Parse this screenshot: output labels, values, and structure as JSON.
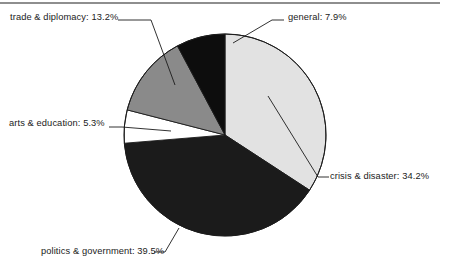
{
  "page": {
    "background_color": "#ffffff",
    "width": 449,
    "height": 271,
    "top_rule_color": "#8e8e8e"
  },
  "chart_data": {
    "type": "pie",
    "title": "",
    "subtitle": "",
    "xlabel": "",
    "ylabel": "",
    "grid": false,
    "legend_position": "none",
    "label_format": "{name}: {value}%",
    "start_angle_deg": 0,
    "direction": "clockwise",
    "center": {
      "x": 225,
      "y": 135
    },
    "radius": 101,
    "outline_color": "#1b1b1b",
    "categories": [
      "crisis & disaster",
      "politics & government",
      "arts & education",
      "trade & diplomacy",
      "general"
    ],
    "values": [
      34.2,
      39.5,
      5.3,
      13.2,
      7.9
    ],
    "slices": [
      {
        "name": "crisis & disaster",
        "value": 34.2,
        "label": "crisis & disaster: 34.2%",
        "color": "#e2e2e2",
        "start_deg": 0.0,
        "end_deg": 123.12
      },
      {
        "name": "politics & government",
        "value": 39.5,
        "label": "politics & government: 39.5%",
        "color": "#1b1b1b",
        "start_deg": 123.12,
        "end_deg": 265.32
      },
      {
        "name": "arts & education",
        "value": 5.3,
        "label": "arts & education: 5.3%",
        "color": "#ffffff",
        "start_deg": 265.32,
        "end_deg": 284.4
      },
      {
        "name": "trade & diplomacy",
        "value": 13.2,
        "label": "trade & diplomacy: 13.2%",
        "color": "#8a8a8a",
        "start_deg": 284.4,
        "end_deg": 331.92
      },
      {
        "name": "general",
        "value": 7.9,
        "label": "general: 7.9%",
        "color": "#0d0d0d",
        "start_deg": 331.92,
        "end_deg": 360.0
      }
    ]
  },
  "labels": {
    "trade": "trade & diplomacy: 13.2%",
    "general": "general: 7.9%",
    "crisis": "crisis & disaster: 34.2%",
    "arts": "arts & education: 5.3%",
    "politics": "politics & government: 39.5%"
  }
}
